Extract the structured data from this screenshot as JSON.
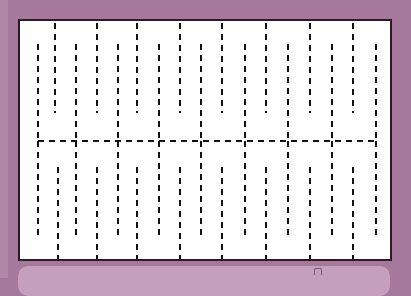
{
  "worksheet": {
    "title": "",
    "colors": {
      "background": "#a6789c",
      "panel": "#ffffff",
      "border": "#2a1a24",
      "dash": "#111111",
      "bottom_bar": "#c4a0bc"
    },
    "pattern": {
      "top_long_lines_x": [
        35,
        77,
        117,
        160,
        202,
        246,
        290,
        333
      ],
      "top_short_lines_x": [
        18,
        56,
        98,
        139,
        181,
        225,
        268,
        312,
        356
      ],
      "horizontal_line_y": 120,
      "bottom_long_lines_x": [
        18,
        56,
        98,
        139,
        181,
        225,
        268,
        312,
        356
      ],
      "bottom_short_lines_x": [
        38,
        77,
        117,
        160,
        202,
        246,
        290,
        333
      ]
    },
    "bottom_bar_icon": "page-icon"
  }
}
